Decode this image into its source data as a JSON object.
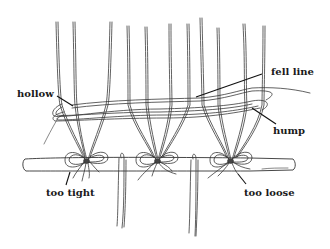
{
  "illustration": {
    "subject": "warp threads tied onto a rod with bow knots, showing weft fell line",
    "background_color": "#ffffff",
    "line_color": "#333333"
  },
  "labels": {
    "fell_line": "fell line",
    "hollow": "hollow",
    "hump": "hump",
    "too_tight": "too tight",
    "too_loose": "too loose"
  },
  "knots": [
    {
      "position": "left",
      "annotation": "too tight"
    },
    {
      "position": "center",
      "annotation": ""
    },
    {
      "position": "right",
      "annotation": "too loose"
    }
  ]
}
